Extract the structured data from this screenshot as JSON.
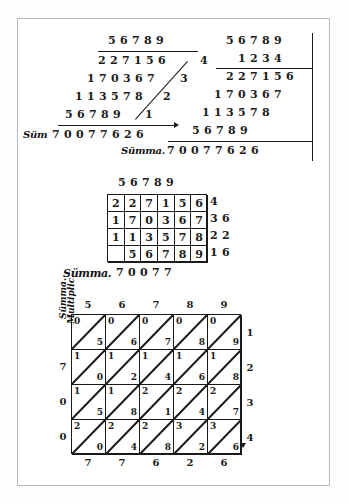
{
  "page": {
    "ink_color": "#1a1a1a",
    "paper_color": "#ffffff",
    "frame_color": "#b8b8b8"
  },
  "labels": {
    "summa_short": "Süm",
    "summa": "Sümma.",
    "multiplic": "Multiplic."
  },
  "top_left_work": {
    "multiplicand": "56789",
    "partials": [
      "227156",
      "170367",
      "113578",
      "56789"
    ],
    "carry_digits": [
      "4",
      "3",
      "2",
      "1"
    ],
    "summa_label": "Süm",
    "total": "70077626"
  },
  "top_right_work": {
    "multiplicand": "56789",
    "multiplier": "1234",
    "partials": [
      "227156",
      "170367",
      "113578",
      "56789"
    ],
    "summa_label": "Sümma.",
    "total": "70077626"
  },
  "middle_grid": {
    "header": [
      "5",
      "6",
      "7",
      "8",
      "9"
    ],
    "rows": [
      {
        "cells": [
          "2",
          "2",
          "7",
          "1",
          "5",
          "6"
        ],
        "extra": [
          "4"
        ]
      },
      {
        "cells": [
          "1",
          "7",
          "0",
          "3",
          "6",
          "7"
        ],
        "extra": [
          "3",
          "6"
        ]
      },
      {
        "cells": [
          "1",
          "1",
          "3",
          "5",
          "7",
          "8"
        ],
        "extra": [
          "2",
          "2"
        ]
      },
      {
        "cells": [
          "",
          "5",
          "6",
          "7",
          "8",
          "9"
        ],
        "extra": [
          "1",
          "6"
        ]
      }
    ],
    "summa_label": "Sümma.",
    "total": [
      "7",
      "0",
      "0",
      "7",
      "7"
    ]
  },
  "chart_data": {
    "type": "table",
    "top_header": [
      "5",
      "6",
      "7",
      "8",
      "9"
    ],
    "right_multipliers": [
      "1",
      "2",
      "3",
      "4"
    ],
    "left_sum_digits": [
      "7",
      "0",
      "0"
    ],
    "left_label": "Sümma.",
    "bottom_sum_digits": [
      "7",
      "7",
      "6",
      "2",
      "6"
    ],
    "cells": [
      [
        {
          "hi": "0",
          "lo": "5"
        },
        {
          "hi": "0",
          "lo": "6"
        },
        {
          "hi": "0",
          "lo": "7"
        },
        {
          "hi": "0",
          "lo": "8"
        },
        {
          "hi": "0",
          "lo": "9"
        }
      ],
      [
        {
          "hi": "1",
          "lo": "0"
        },
        {
          "hi": "1",
          "lo": "2"
        },
        {
          "hi": "1",
          "lo": "4"
        },
        {
          "hi": "1",
          "lo": "6"
        },
        {
          "hi": "1",
          "lo": "8"
        }
      ],
      [
        {
          "hi": "1",
          "lo": "5"
        },
        {
          "hi": "1",
          "lo": "8"
        },
        {
          "hi": "2",
          "lo": "1"
        },
        {
          "hi": "2",
          "lo": "4"
        },
        {
          "hi": "2",
          "lo": "7"
        }
      ],
      [
        {
          "hi": "2",
          "lo": "0"
        },
        {
          "hi": "2",
          "lo": "4"
        },
        {
          "hi": "2",
          "lo": "8"
        },
        {
          "hi": "3",
          "lo": "2"
        },
        {
          "hi": "3",
          "lo": "6"
        }
      ]
    ],
    "product": "70077626"
  }
}
